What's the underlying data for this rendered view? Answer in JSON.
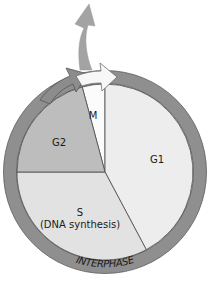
{
  "diagram": {
    "center": [
      105,
      172
    ],
    "inner_radius": 88,
    "ring": {
      "outer_radius": 101,
      "color": "#8f8f8f",
      "edge_color": "#5c5c5c",
      "label": "INTERPHASE"
    },
    "phases": [
      {
        "id": "M",
        "label": "M",
        "start_deg": -15,
        "end_deg": 0,
        "color": "#fbfbfb",
        "label_pos": [
          93,
          119
        ]
      },
      {
        "id": "G1",
        "label": "G1",
        "start_deg": 0,
        "end_deg": 152,
        "color": "#ededed",
        "label_pos": [
          157,
          163
        ]
      },
      {
        "id": "S",
        "label": "S",
        "sublabel": "(DNA synthesis)",
        "start_deg": 152,
        "end_deg": 270,
        "color": "#e2e2e2",
        "label_pos": [
          80,
          216
        ]
      },
      {
        "id": "G2",
        "label": "G2",
        "start_deg": 270,
        "end_deg": 345,
        "color": "#bdbdbd",
        "label_pos": [
          59,
          146
        ]
      }
    ],
    "arrows": {
      "g2_to_m": {
        "color": "#8c8c8c"
      },
      "m_to_g1": {
        "color": "#f7f7f7",
        "edge": "#6e6e6e"
      },
      "exit": {
        "color": "#a3a3a3",
        "meaning": "exit from cycle"
      }
    }
  }
}
